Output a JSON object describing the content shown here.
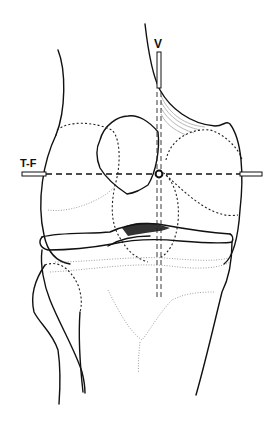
{
  "figure": {
    "labels": {
      "vertical_axis": "V",
      "transverse_axis": "T-F"
    },
    "colors": {
      "line": "#111111",
      "background": "#ffffff",
      "stipple": "#888888"
    }
  }
}
